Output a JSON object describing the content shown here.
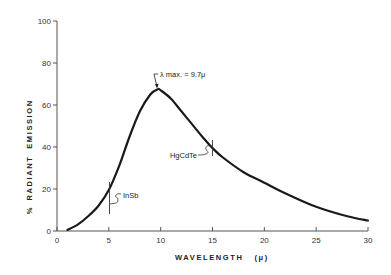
{
  "chart_data": {
    "type": "line",
    "title": "",
    "xlabel": "WAVELENGTH   (μ)",
    "ylabel": "%   RADIANT   EMISSION",
    "xlim": [
      0,
      30
    ],
    "ylim": [
      0,
      100
    ],
    "x_ticks": [
      0,
      5,
      10,
      15,
      20,
      25,
      30
    ],
    "y_ticks": [
      0,
      20,
      40,
      60,
      80,
      100
    ],
    "grid": false,
    "series": [
      {
        "name": "Radiant emission",
        "x": [
          1,
          2,
          3,
          4,
          5,
          6,
          7,
          8,
          9,
          9.7,
          10,
          11,
          12,
          13,
          14,
          15,
          16,
          18,
          20,
          22,
          25,
          28,
          30
        ],
        "values": [
          0.5,
          3,
          7,
          12,
          19.5,
          31,
          45,
          57,
          65,
          67.5,
          67,
          63,
          57,
          51,
          45,
          39.5,
          35,
          28,
          23,
          18,
          11.5,
          7,
          5
        ]
      }
    ],
    "annotations": [
      {
        "text": "λ max. = 9.7μ",
        "x": 9.7,
        "y": 67.5
      },
      {
        "text": "InSb",
        "x": 5,
        "y": 19.5
      },
      {
        "text": "HgCdTe",
        "x": 15,
        "y": 39.5
      }
    ]
  },
  "labels": {
    "xlabel": "WAVELENGTH   (μ)",
    "ylabel_pct": "%",
    "ylabel_radiant": "RADIANT",
    "ylabel_emission": "EMISSION",
    "peak": "λ max. = 9.7μ",
    "insb": "InSb",
    "hgcdte": "HgCdTe"
  },
  "colors": {
    "line": "#1a1a1a",
    "axis": "#555555",
    "text": "#333333"
  }
}
